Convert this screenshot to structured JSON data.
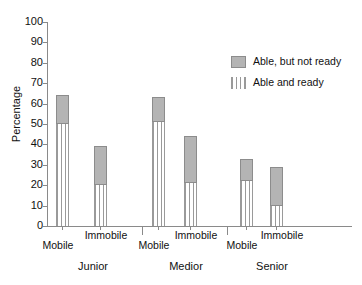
{
  "chart_data": {
    "type": "bar",
    "title": "",
    "subtitle": "",
    "xlabel": "",
    "ylabel": "Percentage",
    "ylim": [
      0,
      100
    ],
    "ytick_labels": [
      "0",
      "10",
      "20",
      "30",
      "40",
      "50",
      "60",
      "70",
      "80",
      "90",
      "100"
    ],
    "ytick_values": [
      0,
      10,
      20,
      30,
      40,
      50,
      60,
      70,
      80,
      90,
      100
    ],
    "grid": false,
    "stacked": true,
    "legend_position": "upper-right",
    "group_labels": [
      "Junior",
      "Medior",
      "Senior"
    ],
    "categories": [
      "Junior Mobile",
      "Junior Immobile",
      "Medior Mobile",
      "Medior Immobile",
      "Senior Mobile",
      "Senior Immobile"
    ],
    "category_labels": [
      "Mobile",
      "Immobile",
      "Mobile",
      "Immobile",
      "Mobile",
      "Immobile"
    ],
    "series": [
      {
        "name": "Able and ready",
        "fill": "vertical-stripes",
        "color": "#9a9a9a",
        "values": [
          50,
          20,
          51,
          21,
          22,
          10
        ]
      },
      {
        "name": "Able, but not ready",
        "fill": "solid",
        "color": "#b4b4b4",
        "values": [
          14,
          19,
          12,
          23,
          11,
          19
        ]
      }
    ],
    "totals": [
      64,
      39,
      63,
      44,
      33,
      29
    ]
  },
  "legend": {
    "items": [
      {
        "label": "Able, but not ready",
        "swatch": "solid"
      },
      {
        "label": "Able and ready",
        "swatch": "striped"
      }
    ]
  },
  "axis": {
    "y_title": "Percentage"
  }
}
